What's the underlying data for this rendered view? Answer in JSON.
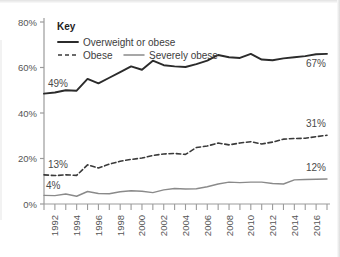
{
  "chart_data": {
    "type": "line",
    "title": "",
    "xlabel": "",
    "ylabel": "",
    "ylim": [
      0,
      80
    ],
    "xlim": [
      1991,
      2017
    ],
    "grid": false,
    "legend_position": "top-left",
    "legend_title": "Key",
    "ytick_labels": [
      "0%",
      "20%",
      "40%",
      "60%",
      "80%"
    ],
    "ytick_values": [
      0,
      20,
      40,
      60,
      80
    ],
    "xtick_labels": [
      "1992",
      "1994",
      "1996",
      "1998",
      "2000",
      "2002",
      "2004",
      "2006",
      "2008",
      "2010",
      "2012",
      "2014",
      "2016"
    ],
    "xtick_values": [
      1992,
      1994,
      1996,
      1998,
      2000,
      2002,
      2004,
      2006,
      2008,
      2010,
      2012,
      2014,
      2016
    ],
    "x": [
      1991,
      1992,
      1993,
      1994,
      1995,
      1996,
      1997,
      1998,
      1999,
      2000,
      2001,
      2002,
      2003,
      2004,
      2005,
      2006,
      2007,
      2008,
      2009,
      2010,
      2011,
      2012,
      2013,
      2014,
      2015,
      2016,
      2017
    ],
    "series": [
      {
        "name": "Overweight or obese",
        "style": "solid",
        "color": "#2b2b2b",
        "width": 1.9,
        "values": [
          48.5,
          49.0,
          50.0,
          49.8,
          55.0,
          53.0,
          55.5,
          58.0,
          60.5,
          59.0,
          63.0,
          61.0,
          60.5,
          60.2,
          61.5,
          63.0,
          65.5,
          64.5,
          64.2,
          66.0,
          63.5,
          63.2,
          64.0,
          64.5,
          65.0,
          65.8,
          66.0
        ],
        "start_label": "49%",
        "end_label": "67%"
      },
      {
        "name": "Obese",
        "style": "dashed",
        "color": "#3a3a3a",
        "width": 1.6,
        "values": [
          12.8,
          12.5,
          12.8,
          12.6,
          17.2,
          15.8,
          17.5,
          18.8,
          19.6,
          20.2,
          21.3,
          22.0,
          22.2,
          21.8,
          24.8,
          25.5,
          26.8,
          26.0,
          26.8,
          27.4,
          26.4,
          27.2,
          28.5,
          28.8,
          28.9,
          29.6,
          30.2
        ],
        "start_label": "13%",
        "end_label": "31%"
      },
      {
        "name": "Severely obese",
        "style": "solid",
        "color": "#8a8a8a",
        "width": 1.4,
        "values": [
          3.8,
          3.7,
          4.4,
          3.4,
          5.5,
          4.6,
          4.5,
          5.4,
          5.8,
          5.6,
          5.0,
          6.2,
          6.8,
          6.6,
          6.7,
          7.6,
          8.8,
          9.6,
          9.4,
          9.6,
          9.6,
          9.0,
          8.8,
          10.6,
          10.8,
          10.9,
          11.0
        ],
        "start_label": "4%",
        "end_label": "12%"
      }
    ],
    "annotations": [
      {
        "name": "overweight-start",
        "text": "49%"
      },
      {
        "name": "overweight-end",
        "text": "67%"
      },
      {
        "name": "obese-start",
        "text": "13%"
      },
      {
        "name": "obese-end",
        "text": "31%"
      },
      {
        "name": "severely-start",
        "text": "4%"
      },
      {
        "name": "severely-end",
        "text": "12%"
      }
    ]
  },
  "legend": {
    "title": "Key",
    "items": [
      {
        "label": "Overweight or obese",
        "style": "solid",
        "color": "#2b2b2b"
      },
      {
        "label": "Obese",
        "style": "dashed",
        "color": "#3a3a3a"
      },
      {
        "label": "Severely obese",
        "style": "solid",
        "color": "#8a8a8a"
      }
    ]
  },
  "colors": {
    "background": "#ffffff",
    "axis": "#9b9b9b",
    "text": "#4b4b4b",
    "overweight": "#2b2b2b",
    "obese": "#3a3a3a",
    "severely": "#8a8a8a"
  }
}
